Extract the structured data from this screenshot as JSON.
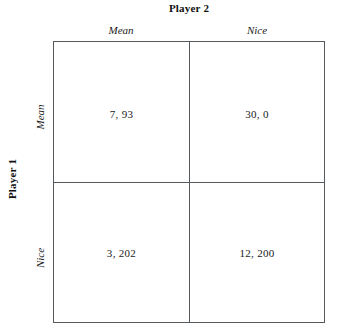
{
  "title": "Player 2",
  "row_player_title": "Player 1",
  "columns": [
    {
      "label": "Mean"
    },
    {
      "label": "Nice"
    }
  ],
  "rows": [
    {
      "label": "Mean"
    },
    {
      "label": "Nice"
    }
  ],
  "cells": [
    {
      "row": "Mean",
      "col": "Mean",
      "value": "7, 93",
      "player1_payoff": 7,
      "player2_payoff": 93
    },
    {
      "row": "Mean",
      "col": "Nice",
      "value": "30, 0",
      "player1_payoff": 30,
      "player2_payoff": 0
    },
    {
      "row": "Nice",
      "col": "Mean",
      "value": "3, 202",
      "player1_payoff": 3,
      "player2_payoff": 202
    },
    {
      "row": "Nice",
      "col": "Nice",
      "value": "12, 200",
      "player1_payoff": 12,
      "player2_payoff": 200
    }
  ],
  "colors": {
    "background": "#ffffff",
    "border": "#555a5e",
    "text": "#1a1a1a"
  }
}
